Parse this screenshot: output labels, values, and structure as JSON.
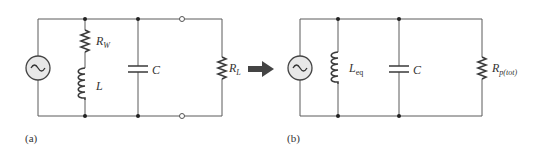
{
  "figure": {
    "panel_a": {
      "caption": "(a)",
      "components": [
        {
          "type": "ac-source",
          "label": ""
        },
        {
          "type": "resistor",
          "label": "R",
          "sub": "W"
        },
        {
          "type": "inductor",
          "label": "L",
          "sub": ""
        },
        {
          "type": "capacitor",
          "label": "C",
          "sub": ""
        },
        {
          "type": "resistor",
          "label": "R",
          "sub": "L"
        }
      ]
    },
    "panel_b": {
      "caption": "(b)",
      "components": [
        {
          "type": "ac-source",
          "label": ""
        },
        {
          "type": "inductor",
          "label": "L",
          "sub": "eq"
        },
        {
          "type": "capacitor",
          "label": "C",
          "sub": ""
        },
        {
          "type": "resistor",
          "label": "R",
          "sub": "p(tot)"
        }
      ]
    },
    "arrow": "right-arrow"
  }
}
